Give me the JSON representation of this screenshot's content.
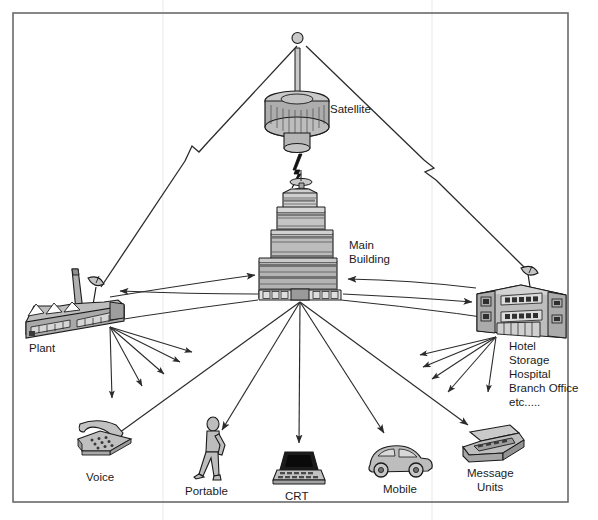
{
  "diagram": {
    "frame": {
      "stroke": "#555555",
      "fill": "#ffffff"
    },
    "palette": {
      "outline": "#1a1a1a",
      "fill_light": "#d9d9d9",
      "fill_mid": "#b8b8b8",
      "fill_dark": "#8f8f8f",
      "fill_darker": "#6b6b6b",
      "screen_black": "#111111",
      "line": "#2b2b2b",
      "text": "#1a1a1a"
    },
    "nodes": [
      {
        "id": "satellite",
        "label": "Satellite",
        "icon": "satellite-drum-icon",
        "x": 297,
        "y": 110
      },
      {
        "id": "main-building",
        "label": "Main\nBuilding",
        "icon": "tower-building-icon",
        "x": 300,
        "y": 240
      },
      {
        "id": "plant",
        "label": "Plant",
        "icon": "factory-plant-icon",
        "x": 68,
        "y": 305
      },
      {
        "id": "remote-sites",
        "label": "Hotel\nStorage\nHospital\nBranch Office\netc.....",
        "icon": "office-building-icon",
        "x": 525,
        "y": 295
      },
      {
        "id": "voice",
        "label": "Voice",
        "icon": "telephone-icon",
        "x": 103,
        "y": 445
      },
      {
        "id": "portable",
        "label": "Portable",
        "icon": "walking-person-icon",
        "x": 212,
        "y": 445
      },
      {
        "id": "crt",
        "label": "CRT",
        "icon": "crt-terminal-icon",
        "x": 299,
        "y": 465
      },
      {
        "id": "mobile",
        "label": "Mobile",
        "icon": "car-icon",
        "x": 397,
        "y": 455
      },
      {
        "id": "message-units",
        "label": "Message\nUnits",
        "icon": "message-unit-icon",
        "x": 490,
        "y": 445
      }
    ],
    "labels": {
      "satellite": "Satellite",
      "main_building_line1": "Main",
      "main_building_line2": "Building",
      "plant": "Plant",
      "remote_line1": "Hotel",
      "remote_line2": "Storage",
      "remote_line3": "Hospital",
      "remote_line4": "Branch Office",
      "remote_line5": "etc.....",
      "voice": "Voice",
      "portable": "Portable",
      "crt": "CRT",
      "mobile": "Mobile",
      "message_line1": "Message",
      "message_line2": "Units"
    },
    "links": [
      {
        "from": "satellite",
        "to": "plant",
        "style": "beam-break"
      },
      {
        "from": "satellite",
        "to": "remote-sites",
        "style": "beam-break"
      },
      {
        "from": "satellite",
        "to": "main-building",
        "style": "lightning"
      },
      {
        "from": "main-building",
        "to": "plant",
        "style": "arrow-curve"
      },
      {
        "from": "plant",
        "to": "main-building",
        "style": "arrow-curve"
      },
      {
        "from": "main-building",
        "to": "remote-sites",
        "style": "arrow-curve"
      },
      {
        "from": "remote-sites",
        "to": "main-building",
        "style": "arrow-curve"
      },
      {
        "from": "main-building",
        "to": "voice",
        "style": "arrow"
      },
      {
        "from": "main-building",
        "to": "portable",
        "style": "arrow"
      },
      {
        "from": "main-building",
        "to": "crt",
        "style": "arrow"
      },
      {
        "from": "main-building",
        "to": "mobile",
        "style": "arrow"
      },
      {
        "from": "main-building",
        "to": "message-units",
        "style": "arrow"
      },
      {
        "from": "plant",
        "to": "fan-1",
        "style": "arrow"
      },
      {
        "from": "plant",
        "to": "fan-2",
        "style": "arrow"
      },
      {
        "from": "plant",
        "to": "fan-3",
        "style": "arrow"
      },
      {
        "from": "plant",
        "to": "fan-4",
        "style": "arrow"
      },
      {
        "from": "plant",
        "to": "fan-5",
        "style": "arrow"
      },
      {
        "from": "remote-sites",
        "to": "fan-6",
        "style": "arrow"
      },
      {
        "from": "remote-sites",
        "to": "fan-7",
        "style": "arrow"
      },
      {
        "from": "remote-sites",
        "to": "fan-8",
        "style": "arrow"
      },
      {
        "from": "remote-sites",
        "to": "fan-9",
        "style": "arrow"
      },
      {
        "from": "remote-sites",
        "to": "fan-10",
        "style": "arrow"
      }
    ]
  }
}
